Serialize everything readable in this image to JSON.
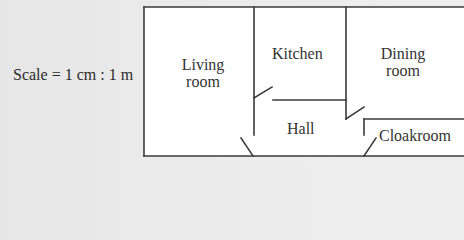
{
  "scale": {
    "label": "Scale = 1 cm : 1 m"
  },
  "rooms": {
    "living": {
      "line1": "Living",
      "line2": "room"
    },
    "kitchen": {
      "label": "Kitchen"
    },
    "dining": {
      "line1": "Dining",
      "line2": "room"
    },
    "hall": {
      "label": "Hall"
    },
    "cloakroom": {
      "label": "Cloakroom"
    }
  },
  "colors": {
    "wall": "#3a3a3a",
    "room_fill": "#ffffff",
    "background": "#ebebeb"
  }
}
